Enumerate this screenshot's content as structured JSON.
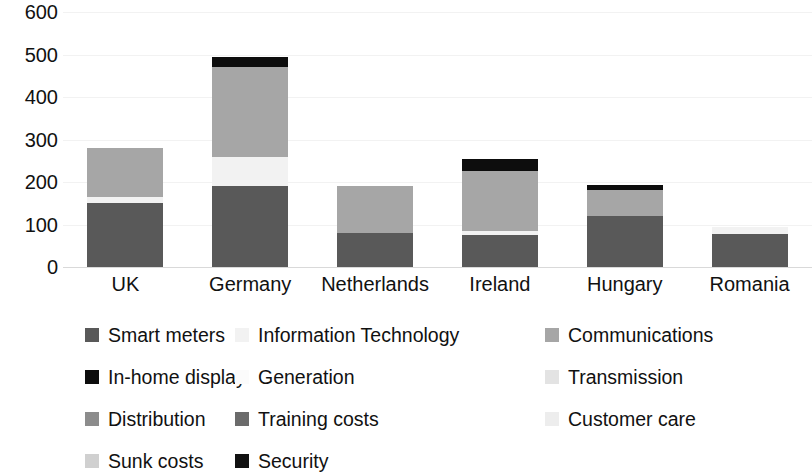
{
  "chart_data": {
    "type": "bar",
    "subtype": "stacked-bar",
    "title": "",
    "xlabel": "",
    "ylabel": "",
    "ylim": [
      0,
      600
    ],
    "y_ticks": [
      0,
      100,
      200,
      300,
      400,
      500,
      600
    ],
    "y_tick_labels": [
      "0",
      "100",
      "200",
      "300",
      "400",
      "500",
      "600"
    ],
    "grid": true,
    "legend_position": "bottom",
    "categories": [
      "UK",
      "Germany",
      "Netherlands",
      "Ireland",
      "Hungary",
      "Romania"
    ],
    "series": [
      {
        "name": "Smart meters",
        "color": "#595959",
        "values": [
          150,
          190,
          80,
          75,
          120,
          78
        ]
      },
      {
        "name": "Information Technology",
        "color": "#f2f2f2",
        "values": [
          15,
          70,
          0,
          10,
          0,
          17
        ]
      },
      {
        "name": "Communications",
        "color": "#a6a6a6",
        "values": [
          115,
          210,
          110,
          140,
          62,
          0
        ]
      },
      {
        "name": "In-home display",
        "color": "#0d0d0d",
        "values": [
          0,
          25,
          0,
          30,
          10,
          0
        ]
      },
      {
        "name": "Generation",
        "color": "#fbfbfb",
        "values": [
          0,
          0,
          0,
          0,
          0,
          0
        ]
      },
      {
        "name": "Transmission",
        "color": "#e3e3e3",
        "values": [
          0,
          0,
          0,
          0,
          0,
          0
        ]
      },
      {
        "name": "Distribution",
        "color": "#8c8c8c",
        "values": [
          0,
          0,
          0,
          0,
          0,
          0
        ]
      },
      {
        "name": "Training costs",
        "color": "#6b6b6b",
        "values": [
          0,
          0,
          0,
          0,
          0,
          0
        ]
      },
      {
        "name": "Customer care",
        "color": "#ededed",
        "values": [
          0,
          0,
          0,
          0,
          0,
          0
        ]
      },
      {
        "name": "Sunk costs",
        "color": "#d0d0d0",
        "values": [
          0,
          0,
          0,
          0,
          0,
          0
        ]
      },
      {
        "name": "Security",
        "color": "#111111",
        "values": [
          0,
          0,
          0,
          0,
          0,
          0
        ]
      }
    ],
    "stack_order_by_category": {
      "UK": [
        "Smart meters",
        "Information Technology",
        "Communications"
      ],
      "Germany": [
        "Smart meters",
        "Information Technology",
        "Communications",
        "In-home display"
      ],
      "Netherlands": [
        "Smart meters",
        "Communications",
        "Information Technology"
      ],
      "Ireland": [
        "Smart meters",
        "Information Technology",
        "Communications",
        "In-home display"
      ],
      "Hungary": [
        "Smart meters",
        "Communications",
        "In-home display",
        "Information Technology"
      ],
      "Romania": [
        "Smart meters",
        "Information Technology"
      ]
    },
    "totals": [
      280,
      495,
      235,
      255,
      232,
      95
    ]
  },
  "legend": {
    "columns": 3,
    "items": [
      {
        "label": "Smart meters",
        "color": "#595959",
        "row": 0,
        "col": 0
      },
      {
        "label": "Information Technology",
        "color": "#f2f2f2",
        "row": 0,
        "col": 1
      },
      {
        "label": "Communications",
        "color": "#a6a6a6",
        "row": 0,
        "col": 2
      },
      {
        "label": "In-home display",
        "color": "#0d0d0d",
        "row": 1,
        "col": 0
      },
      {
        "label": "Generation",
        "color": "#fbfbfb",
        "row": 1,
        "col": 1
      },
      {
        "label": "Transmission",
        "color": "#e3e3e3",
        "row": 1,
        "col": 2
      },
      {
        "label": "Distribution",
        "color": "#8c8c8c",
        "row": 2,
        "col": 0
      },
      {
        "label": "Training costs",
        "color": "#6b6b6b",
        "row": 2,
        "col": 1
      },
      {
        "label": "Customer care",
        "color": "#ededed",
        "row": 2,
        "col": 2
      },
      {
        "label": "Sunk costs",
        "color": "#d0d0d0",
        "row": 3,
        "col": 0
      },
      {
        "label": "Security",
        "color": "#111111",
        "row": 3,
        "col": 1
      }
    ]
  }
}
